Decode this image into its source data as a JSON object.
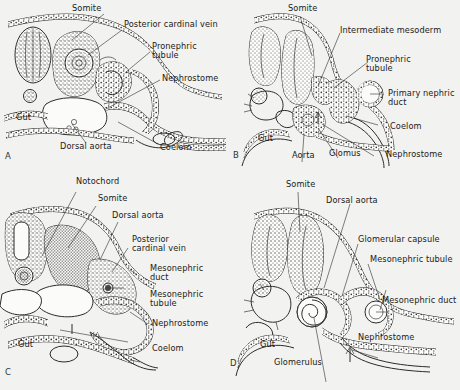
{
  "figure": {
    "background_color": "#f2f2f0",
    "ink_color": "#2b2b2b",
    "panel_count": 4
  },
  "panels": [
    {
      "id": "A",
      "letter": "A",
      "stage": "pronephros",
      "labels": [
        {
          "key": "somite",
          "text": "Somite"
        },
        {
          "key": "pcv",
          "text": "Posterior cardinal vein"
        },
        {
          "key": "pronephric",
          "text": "Pronephric"
        },
        {
          "key": "tubule",
          "text": "tubule"
        },
        {
          "key": "nephrostome",
          "text": "Nephrostome"
        },
        {
          "key": "gut",
          "text": "Gut"
        },
        {
          "key": "dorsal_aorta",
          "text": "Dorsal aorta"
        },
        {
          "key": "coelom",
          "text": "Coelom"
        }
      ]
    },
    {
      "id": "B",
      "letter": "B",
      "stage": "pronephric tubule and primary nephric duct",
      "labels": [
        {
          "key": "somite",
          "text": "Somite"
        },
        {
          "key": "int_mesoderm",
          "text": "Intermediate mesoderm"
        },
        {
          "key": "pronephric",
          "text": "Pronephric"
        },
        {
          "key": "tubule",
          "text": "tubule"
        },
        {
          "key": "primary_duct1",
          "text": "Primary nephric"
        },
        {
          "key": "primary_duct2",
          "text": "duct"
        },
        {
          "key": "coelom",
          "text": "Coelom"
        },
        {
          "key": "nephrostome",
          "text": "Nephrostome"
        },
        {
          "key": "gut",
          "text": "Gut"
        },
        {
          "key": "aorta",
          "text": "Aorta"
        },
        {
          "key": "glomus",
          "text": "Glomus"
        }
      ]
    },
    {
      "id": "C",
      "letter": "C",
      "stage": "early mesonephros",
      "labels": [
        {
          "key": "notochord",
          "text": "Notochord"
        },
        {
          "key": "somite",
          "text": "Somite"
        },
        {
          "key": "dorsal_aorta",
          "text": "Dorsal aorta"
        },
        {
          "key": "pcv1",
          "text": "Posterior"
        },
        {
          "key": "pcv2",
          "text": "cardinal vein"
        },
        {
          "key": "meso_duct1",
          "text": "Mesonephric"
        },
        {
          "key": "meso_duct2",
          "text": "duct"
        },
        {
          "key": "meso_tub1",
          "text": "Mesonephric"
        },
        {
          "key": "meso_tub2",
          "text": "tubule"
        },
        {
          "key": "nephrostome",
          "text": "Nephrostome"
        },
        {
          "key": "coelom",
          "text": "Coelom"
        },
        {
          "key": "gut",
          "text": "Gut"
        }
      ]
    },
    {
      "id": "D",
      "letter": "D",
      "stage": "mesonephros with glomerulus",
      "labels": [
        {
          "key": "somite",
          "text": "Somite"
        },
        {
          "key": "dorsal_aorta",
          "text": "Dorsal aorta"
        },
        {
          "key": "glom_capsule",
          "text": "Glomerular capsule"
        },
        {
          "key": "meso_tubule",
          "text": "Mesonephric tubule"
        },
        {
          "key": "meso_duct",
          "text": "Mesonephric duct"
        },
        {
          "key": "nephrostome",
          "text": "Nephrostome"
        },
        {
          "key": "glomerulus",
          "text": "Glomerulus"
        },
        {
          "key": "gut",
          "text": "Gut"
        }
      ]
    }
  ]
}
